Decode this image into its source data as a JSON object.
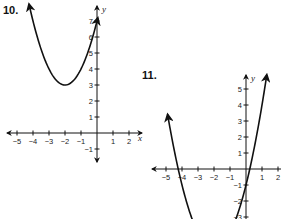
{
  "chart_data": [
    {
      "type": "line",
      "title": "10.",
      "function": "y = (x + 2)^2 + 3",
      "vertex": [
        -2,
        3
      ],
      "x": [
        -4.3,
        -4,
        -3.5,
        -3,
        -2.5,
        -2,
        -1.5,
        -1,
        -0.5,
        0
      ],
      "y": [
        8.29,
        7,
        5.25,
        4,
        3.25,
        3,
        3.25,
        4,
        5.25,
        7
      ],
      "xlabel": "x",
      "ylabel": "y",
      "xticks": [
        "-5",
        "-4",
        "-3",
        "-2",
        "-1",
        "1",
        "2"
      ],
      "yticks": [
        "-1",
        "1",
        "2",
        "3",
        "4",
        "5",
        "6",
        "7"
      ],
      "xlim": [
        -5.5,
        2.5
      ],
      "ylim": [
        -1.5,
        8
      ],
      "grid": false,
      "legend": null
    },
    {
      "type": "line",
      "title": "11.",
      "function": "y = (x + 2)^2 - 5",
      "vertex": [
        -2,
        -5
      ],
      "x_intercepts": [
        -4.24,
        0.24
      ],
      "x": [
        -4.7,
        -4.24,
        -4,
        -3.5,
        -3,
        -2.5,
        -2,
        -1.5,
        -1,
        -0.5,
        0,
        0.24,
        0.5,
        1,
        1.35
      ],
      "y": [
        2.29,
        0,
        -1,
        -2.75,
        -4,
        -4.75,
        -5,
        -4.75,
        -4,
        -2.75,
        -1,
        0,
        1.25,
        4,
        6.22
      ],
      "xlabel": "x",
      "ylabel": "y",
      "xticks": [
        "-5",
        "-4",
        "-3",
        "-2",
        "-1",
        "1",
        "2"
      ],
      "yticks": [
        "-3",
        "-2",
        "-1",
        "1",
        "2",
        "3",
        "4",
        "5"
      ],
      "xlim": [
        -5.5,
        2.5
      ],
      "ylim": [
        -3.2,
        6
      ],
      "grid": false,
      "legend": null
    }
  ],
  "graph10": {
    "number": "10.",
    "xlabel": "x",
    "ylabel": "y",
    "xticks": [
      {
        "v": -5,
        "t": "−5"
      },
      {
        "v": -4,
        "t": "−4"
      },
      {
        "v": -3,
        "t": "−3"
      },
      {
        "v": -2,
        "t": "−2"
      },
      {
        "v": -1,
        "t": "−1"
      },
      {
        "v": 1,
        "t": "1"
      },
      {
        "v": 2,
        "t": "2"
      }
    ],
    "yticks": [
      {
        "v": -1,
        "t": "−1"
      },
      {
        "v": 1,
        "t": "1"
      },
      {
        "v": 2,
        "t": "2"
      },
      {
        "v": 3,
        "t": "3"
      },
      {
        "v": 4,
        "t": "4"
      },
      {
        "v": 5,
        "t": "5"
      },
      {
        "v": 6,
        "t": "6"
      },
      {
        "v": 7,
        "t": "7"
      }
    ]
  },
  "graph11": {
    "number": "11.",
    "xlabel": "x",
    "ylabel": "y",
    "xticks": [
      {
        "v": -5,
        "t": "−5"
      },
      {
        "v": -4,
        "t": "−4"
      },
      {
        "v": -3,
        "t": "−3"
      },
      {
        "v": -2,
        "t": "−2"
      },
      {
        "v": -1,
        "t": "−1"
      },
      {
        "v": 1,
        "t": "1"
      },
      {
        "v": 2,
        "t": "2"
      }
    ],
    "yticks": [
      {
        "v": -3,
        "t": "−3"
      },
      {
        "v": -2,
        "t": "−2"
      },
      {
        "v": -1,
        "t": "−1"
      },
      {
        "v": 1,
        "t": "1"
      },
      {
        "v": 2,
        "t": "2"
      },
      {
        "v": 3,
        "t": "3"
      },
      {
        "v": 4,
        "t": "4"
      },
      {
        "v": 5,
        "t": "5"
      }
    ]
  },
  "colors": {
    "ink": "#111111",
    "background": "#ffffff"
  }
}
